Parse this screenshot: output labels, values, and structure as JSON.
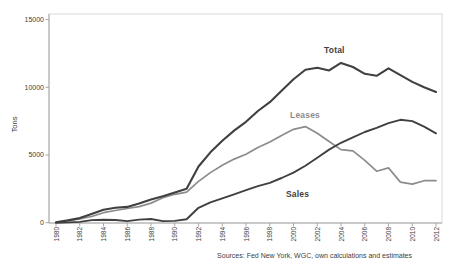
{
  "chart_data": {
    "type": "line",
    "title": "",
    "xlabel": "",
    "ylabel": "Tons",
    "ylim": [
      0,
      15000
    ],
    "yticks": [
      0,
      5000,
      10000,
      15000
    ],
    "xtick_interval": 2,
    "grid": false,
    "legend_position": "inline-labels",
    "x": [
      1980,
      1981,
      1982,
      1983,
      1984,
      1985,
      1986,
      1987,
      1988,
      1989,
      1990,
      1991,
      1992,
      1993,
      1994,
      1995,
      1996,
      1997,
      1998,
      1999,
      2000,
      2001,
      2002,
      2003,
      2004,
      2005,
      2006,
      2007,
      2008,
      2009,
      2010,
      2011,
      2012
    ],
    "xticks": [
      1980,
      1982,
      1984,
      1986,
      1988,
      1990,
      1992,
      1994,
      1996,
      1998,
      2000,
      2002,
      2004,
      2006,
      2008,
      2010,
      2012
    ],
    "series": [
      {
        "name": "Leases",
        "color": "#8c8c8c",
        "width": 1.7,
        "values": [
          30,
          150,
          280,
          460,
          740,
          900,
          1050,
          1190,
          1450,
          1840,
          2100,
          2250,
          3050,
          3700,
          4250,
          4700,
          5050,
          5550,
          5950,
          6450,
          6900,
          7100,
          6600,
          6000,
          5400,
          5300,
          4600,
          3800,
          4050,
          3000,
          2850,
          3100,
          3100
        ]
      },
      {
        "name": "Total",
        "color": "#404040",
        "width": 2.1,
        "values": [
          30,
          170,
          340,
          650,
          960,
          1100,
          1170,
          1420,
          1720,
          1960,
          2230,
          2500,
          4150,
          5200,
          6050,
          6800,
          7450,
          8250,
          8900,
          9750,
          10600,
          11300,
          11450,
          11250,
          11800,
          11500,
          11000,
          10850,
          11400,
          10900,
          10400,
          10000,
          9650
        ]
      },
      {
        "name": "Sales",
        "color": "#404040",
        "width": 1.9,
        "values": [
          0,
          20,
          60,
          190,
          220,
          200,
          120,
          230,
          270,
          120,
          130,
          250,
          1100,
          1500,
          1800,
          2100,
          2400,
          2700,
          2950,
          3300,
          3700,
          4200,
          4800,
          5400,
          5900,
          6300,
          6700,
          7000,
          7350,
          7600,
          7500,
          7100,
          6600
        ]
      }
    ],
    "series_labels": {
      "total": "Total",
      "leases": "Leases",
      "sales": "Sales"
    },
    "source": "Sources: Fed New York, WGC, own calculations and estimates",
    "colors": {
      "dark_line": "#404040",
      "gray_line": "#8c8c8c",
      "axis": "#a6a6a6",
      "plot_border": "#d9d9d9",
      "tick_text": "#404040"
    }
  }
}
